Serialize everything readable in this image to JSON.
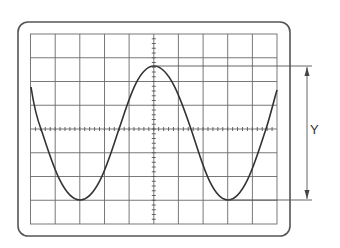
{
  "diagram": {
    "type": "oscilloscope-screen",
    "label_y": "Y",
    "grid": {
      "columns": 10,
      "rows": 8
    },
    "colors": {
      "frame": "#555555",
      "grid": "#666666",
      "trace": "#333333",
      "measure": "#555555"
    }
  }
}
